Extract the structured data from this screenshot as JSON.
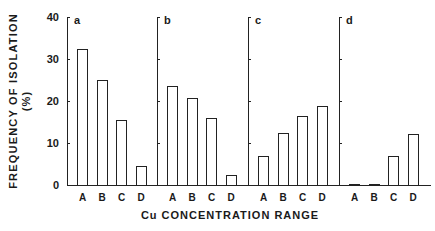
{
  "chart_data": {
    "type": "bar",
    "title": "",
    "ylabel": "FREQUENCY OF ISOLATION",
    "ylabel_unit": "(%)",
    "xlabel": "Cu CONCENTRATION RANGE",
    "ylim": [
      0,
      40
    ],
    "yticks": [
      0,
      10,
      20,
      30,
      40
    ],
    "categories": [
      "A",
      "B",
      "C",
      "D"
    ],
    "grid": false,
    "legend": null,
    "panels": [
      {
        "label": "a",
        "values": [
          32.4,
          25.0,
          15.5,
          4.5
        ]
      },
      {
        "label": "b",
        "values": [
          23.6,
          20.6,
          16.0,
          2.3
        ]
      },
      {
        "label": "c",
        "values": [
          6.9,
          12.3,
          16.4,
          18.9
        ]
      },
      {
        "label": "d",
        "values": [
          0.2,
          0.2,
          7.0,
          12.1
        ]
      }
    ]
  },
  "layout": {
    "y0": 185,
    "pxPerUnit": 4.2,
    "panelAxesX": [
      67,
      157,
      248,
      339
    ],
    "baselineStart": 67,
    "baselineEnd": 431,
    "barOffsets": [
      10,
      29.5,
      49,
      68.5
    ]
  }
}
